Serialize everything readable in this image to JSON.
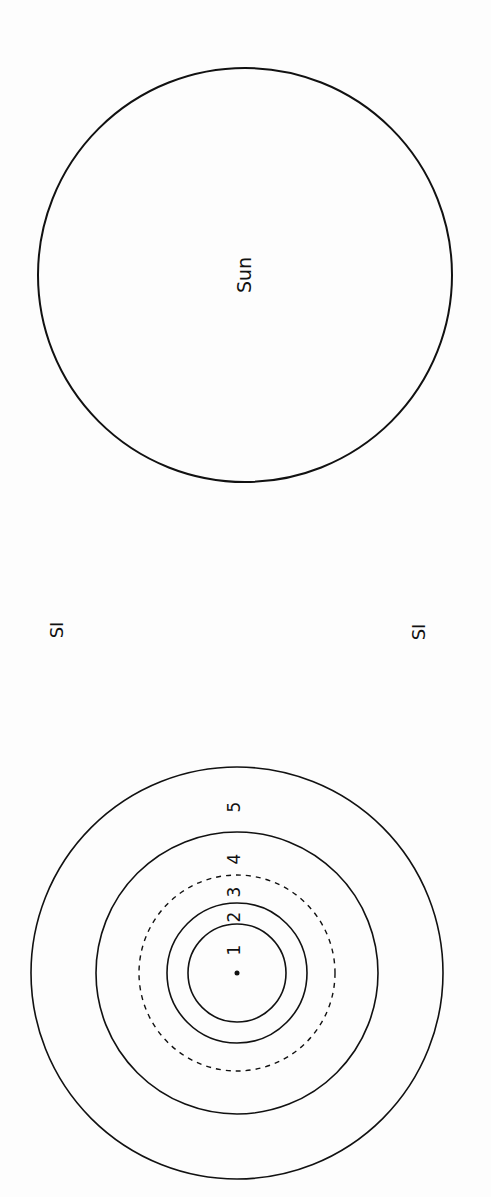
{
  "diagram": {
    "sun": {
      "label": "Sun",
      "cx": 245,
      "cy": 275,
      "r": 207
    },
    "side_labels": [
      {
        "label": "SI",
        "x": 58,
        "y": 630
      },
      {
        "label": "SI",
        "x": 420,
        "y": 632
      }
    ],
    "rings": {
      "cx": 237,
      "cy": 973,
      "items": [
        {
          "label": "1",
          "r": 49,
          "dashed": false,
          "label_y": 950
        },
        {
          "label": "2",
          "r": 70,
          "dashed": false,
          "label_y": 917
        },
        {
          "label": "3",
          "r": 98,
          "dashed": true,
          "label_y": 892
        },
        {
          "label": "4",
          "r": 141,
          "dashed": false,
          "label_y": 859
        },
        {
          "label": "5",
          "r": 206,
          "dashed": false,
          "label_y": 807
        }
      ]
    },
    "stroke_color": "#111111",
    "background": "#fdfdfd"
  }
}
